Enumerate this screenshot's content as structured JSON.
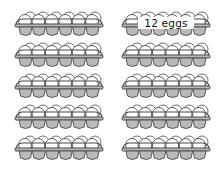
{
  "colors": {
    "cup_fill": "#b9b9b9",
    "outline": "#4a4a4a",
    "egg_fill": "#ffffff"
  },
  "layout": {
    "columns": 2,
    "rows": 5,
    "eggs_per_carton": 12
  },
  "cartons": [
    {
      "id": "c1",
      "col": 0,
      "row": 0,
      "label": null
    },
    {
      "id": "c2",
      "col": 1,
      "row": 0,
      "label": "12 eggs"
    },
    {
      "id": "c3",
      "col": 0,
      "row": 1,
      "label": null
    },
    {
      "id": "c4",
      "col": 1,
      "row": 1,
      "label": null
    },
    {
      "id": "c5",
      "col": 0,
      "row": 2,
      "label": null
    },
    {
      "id": "c6",
      "col": 1,
      "row": 2,
      "label": null
    },
    {
      "id": "c7",
      "col": 0,
      "row": 3,
      "label": null
    },
    {
      "id": "c8",
      "col": 1,
      "row": 3,
      "label": null
    },
    {
      "id": "c9",
      "col": 0,
      "row": 4,
      "label": null
    },
    {
      "id": "c10",
      "col": 1,
      "row": 4,
      "label": null
    }
  ],
  "label_text": "12 eggs"
}
